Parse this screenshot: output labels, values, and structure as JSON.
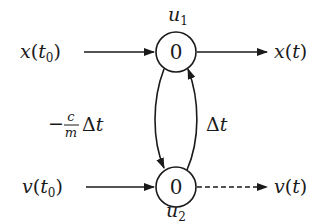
{
  "diagram": {
    "type": "signal-flow-graph",
    "nodes": [
      {
        "id": "u1",
        "label_var": "u",
        "label_sub": "1",
        "value": "0"
      },
      {
        "id": "u2",
        "label_var": "u",
        "label_sub": "2",
        "value": "0"
      }
    ],
    "inputs": [
      {
        "id": "x_t0",
        "var": "x",
        "arg_var": "t",
        "arg_sub": "0",
        "target": "u1"
      },
      {
        "id": "v_t0",
        "var": "v",
        "arg_var": "t",
        "arg_sub": "0",
        "target": "u2"
      }
    ],
    "outputs": [
      {
        "id": "x_t",
        "var": "x",
        "arg": "t",
        "source": "u1",
        "style": "solid"
      },
      {
        "id": "v_t",
        "var": "v",
        "arg": "t",
        "source": "u2",
        "style": "dashed"
      }
    ],
    "edges": [
      {
        "from": "u1",
        "to": "u2",
        "gain_sign": "−",
        "gain_num": "c",
        "gain_den": "m",
        "gain_delta": "Δ",
        "gain_var": "t"
      },
      {
        "from": "u2",
        "to": "u1",
        "gain_delta": "Δ",
        "gain_var": "t"
      }
    ],
    "colors": {
      "ink": "#1a1a1a",
      "background": "#ffffff"
    }
  }
}
